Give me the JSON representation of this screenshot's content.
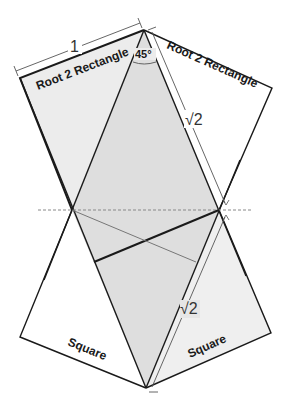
{
  "diagram": {
    "labels": {
      "left_rect": "Root 2 Rectangle",
      "right_rect": "Root 2 Rectangle",
      "left_square": "Square",
      "right_square": "Square",
      "angle": "45°",
      "side_one": "1",
      "upper_root2": "√2",
      "lower_root2": "√2"
    },
    "colors": {
      "background": "#ffffff",
      "light_fill": "#ececec",
      "mid_fill": "#dcdcdc",
      "stroke": "#1a1a1a",
      "thin_stroke": "#777777",
      "dashed": "#888888"
    }
  }
}
